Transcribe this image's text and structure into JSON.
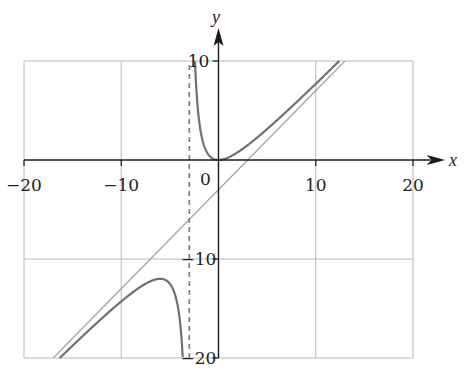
{
  "chart_data": {
    "type": "line",
    "title": "",
    "function": "y = x^2 / (x + 3)",
    "xlabel": "x",
    "ylabel": "y",
    "xlim": [
      -20,
      20
    ],
    "ylim": [
      -20,
      10
    ],
    "grid": true,
    "x_ticks": [
      -20,
      -10,
      0,
      10,
      20
    ],
    "x_tick_labels": [
      "−20",
      "−10",
      "0",
      "10",
      "20"
    ],
    "y_ticks": [
      10,
      -10,
      -20
    ],
    "y_tick_labels": [
      "10",
      "−10",
      "−20"
    ],
    "origin_label": "0",
    "series": [
      {
        "name": "f(x) = x²/(x+3)",
        "style": "solid",
        "color": "#707070",
        "branches": [
          {
            "x_range": [
              -16.32,
              -3.68
            ],
            "sample_points": [
              [
                -16.32,
                -20
              ],
              [
                -10,
                -14.29
              ],
              [
                -6,
                -12
              ],
              [
                -5,
                -12.5
              ],
              [
                -4,
                -16
              ],
              [
                -3.68,
                -20
              ]
            ]
          },
          {
            "x_range": [
              -2.42,
              12.42
            ],
            "sample_points": [
              [
                -2.42,
                10
              ],
              [
                -2,
                4
              ],
              [
                -1,
                0.5
              ],
              [
                0,
                0
              ],
              [
                1,
                0.25
              ],
              [
                5,
                3.125
              ],
              [
                10,
                7.69
              ],
              [
                12.42,
                10
              ]
            ]
          }
        ]
      },
      {
        "name": "slant asymptote y = x − 3",
        "style": "solid",
        "color": "#a8a8a8",
        "points": [
          [
            -17,
            -20
          ],
          [
            13,
            10
          ]
        ]
      },
      {
        "name": "vertical asymptote x = −3",
        "style": "dashed",
        "color": "#808080",
        "points": [
          [
            -3,
            -20
          ],
          [
            -3,
            10
          ]
        ]
      }
    ],
    "annotations": {
      "local_max": [
        -6,
        -12
      ],
      "local_min": [
        0,
        0
      ]
    }
  },
  "colors": {
    "curve": "#707070",
    "asymptote_line": "#a8a8a8",
    "asymptote_dashed": "#7a7a7a",
    "grid": "#b8b8b8",
    "axis": "#1a1a1a"
  }
}
